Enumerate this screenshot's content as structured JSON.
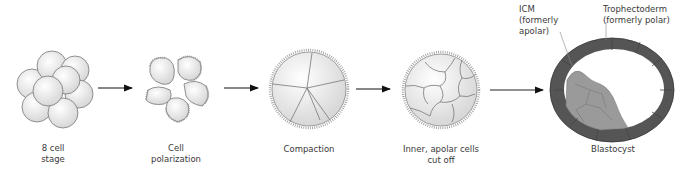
{
  "stages": [
    {
      "id": "8-cell",
      "label_line1": "8 cell",
      "label_line2": "stage"
    },
    {
      "id": "polarization",
      "label_line1": "Cell",
      "label_line2": "polarization"
    },
    {
      "id": "compaction",
      "label_line1": "Compaction",
      "label_line2": ""
    },
    {
      "id": "inner-cutoff",
      "label_line1": "Inner, apolar cells",
      "label_line2": "cut off"
    },
    {
      "id": "blastocyst",
      "label_line1": "Blastocyst",
      "label_line2": ""
    }
  ],
  "callouts": {
    "icm": {
      "line1": "ICM",
      "line2": "(formerly",
      "line3": "apolar)"
    },
    "trophectoderm": {
      "line1": "Trophectoderm",
      "line2": "(formerly polar)"
    }
  },
  "colors": {
    "cell_fill": "#e8e8e8",
    "cell_stroke": "#6e6e6e",
    "trophectoderm": "#555555",
    "icm": "#9a9a9a",
    "arrow": "#111111"
  }
}
